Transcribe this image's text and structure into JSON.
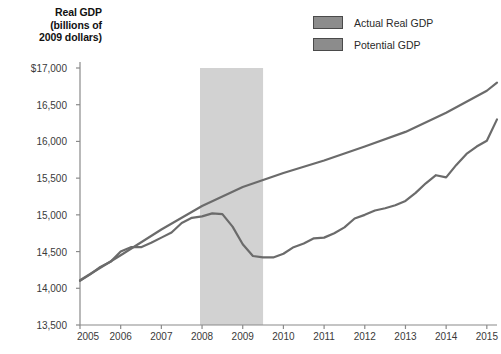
{
  "chart_data": {
    "type": "line",
    "title": "Real GDP (billions of 2009 dollars)",
    "title_lines": [
      "Real GDP",
      "(billions of",
      "2009 dollars)"
    ],
    "xlabel": "",
    "ylabel": "Real GDP (billions of 2009 dollars)",
    "xlim": [
      2005,
      2015.25
    ],
    "ylim": [
      13500,
      17000
    ],
    "grid": false,
    "legend_position": "top-right",
    "x_tick_labels": [
      "2005",
      "2006",
      "2007",
      "2008",
      "2009",
      "2010",
      "2011",
      "2012",
      "2013",
      "2014",
      "2015"
    ],
    "x_ticks": [
      2005,
      2006,
      2007,
      2008,
      2009,
      2010,
      2011,
      2012,
      2013,
      2014,
      2015
    ],
    "y_tick_labels": [
      "$17,000",
      "16,500",
      "16,000",
      "15,500",
      "15,000",
      "14,500",
      "14,000",
      "13,500"
    ],
    "y_ticks": [
      17000,
      16500,
      16000,
      15500,
      15000,
      14500,
      14000,
      13500
    ],
    "annotations": [
      {
        "type": "shaded-band",
        "name": "recession-band",
        "x_start": 2007.95,
        "x_end": 2009.5,
        "color": "#d2d2d2",
        "label": "Recession"
      }
    ],
    "series": [
      {
        "name": "Actual Real GDP",
        "color": "#6b6b6b",
        "x": [
          2005.0,
          2005.25,
          2005.5,
          2005.75,
          2006.0,
          2006.25,
          2006.5,
          2006.75,
          2007.0,
          2007.25,
          2007.5,
          2007.75,
          2008.0,
          2008.25,
          2008.5,
          2008.75,
          2009.0,
          2009.25,
          2009.5,
          2009.75,
          2010.0,
          2010.25,
          2010.5,
          2010.75,
          2011.0,
          2011.25,
          2011.5,
          2011.75,
          2012.0,
          2012.25,
          2012.5,
          2012.75,
          2013.0,
          2013.25,
          2013.5,
          2013.75,
          2014.0,
          2014.25,
          2014.5,
          2014.75,
          2015.0,
          2015.25
        ],
        "values": [
          14100,
          14190,
          14290,
          14360,
          14500,
          14560,
          14560,
          14620,
          14690,
          14760,
          14890,
          14960,
          14980,
          15020,
          15010,
          14840,
          14600,
          14440,
          14420,
          14420,
          14470,
          14560,
          14610,
          14680,
          14690,
          14750,
          14830,
          14950,
          15000,
          15060,
          15090,
          15130,
          15190,
          15300,
          15430,
          15540,
          15510,
          15680,
          15830,
          15930,
          16010,
          16300
        ]
      },
      {
        "name": "Potential GDP",
        "color": "#6b6b6b",
        "x": [
          2005.0,
          2006.0,
          2007.0,
          2008.0,
          2009.0,
          2010.0,
          2011.0,
          2012.0,
          2013.0,
          2014.0,
          2015.0,
          2015.25
        ],
        "values": [
          14110,
          14450,
          14800,
          15120,
          15380,
          15570,
          15740,
          15930,
          16130,
          16390,
          16690,
          16800
        ]
      }
    ]
  },
  "legend": {
    "items": [
      {
        "label": "Actual Real GDP",
        "color": "#8c8c8c"
      },
      {
        "label": "Potential GDP",
        "color": "#8c8c8c"
      }
    ]
  },
  "colors": {
    "line": "#6b6b6b",
    "band": "#d2d2d2",
    "axis": "#8a8a8a",
    "text": "#3a3a3a"
  }
}
